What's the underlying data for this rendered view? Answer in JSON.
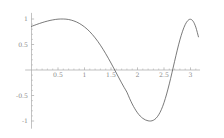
{
  "chart_data": {
    "type": "line",
    "title": "",
    "xlabel": "",
    "ylabel": "",
    "xlim": [
      -0.12,
      3.18
    ],
    "ylim": [
      -1.15,
      1.12
    ],
    "grid": false,
    "legend": null,
    "axis_style": "crossed-axes-at-origin",
    "line_color": "#4d4d4d",
    "axis_color": "#a8a8a8",
    "xticks": [
      0.5,
      1,
      1.5,
      2,
      2.5,
      3
    ],
    "xtick_labels": [
      "0.5",
      "1",
      "1.5",
      "2",
      "2.5",
      "3"
    ],
    "xticks_minor": [
      0.1,
      0.2,
      0.3,
      0.4,
      0.6,
      0.7,
      0.8,
      0.9,
      1.1,
      1.2,
      1.3,
      1.4,
      1.6,
      1.7,
      1.8,
      1.9,
      2.1,
      2.2,
      2.3,
      2.4,
      2.6,
      2.7,
      2.8,
      2.9,
      3.1
    ],
    "yticks": [
      -1,
      -0.5,
      0.5,
      1
    ],
    "ytick_labels": [
      "-1",
      "-0.5",
      "0.5",
      "1"
    ],
    "yticks_minor": [
      -0.9,
      -0.8,
      -0.7,
      -0.6,
      -0.4,
      -0.3,
      -0.2,
      -0.1,
      0.1,
      0.2,
      0.3,
      0.4,
      0.6,
      0.7,
      0.8,
      0.9
    ],
    "series": [
      {
        "name": "curve",
        "x": [
          0.0,
          0.05,
          0.1,
          0.15,
          0.2,
          0.25,
          0.3,
          0.35,
          0.4,
          0.45,
          0.5,
          0.55,
          0.6,
          0.65,
          0.7,
          0.75,
          0.8,
          0.85,
          0.9,
          0.95,
          1.0,
          1.05,
          1.1,
          1.15,
          1.2,
          1.25,
          1.3,
          1.35,
          1.4,
          1.45,
          1.5,
          1.55,
          1.6,
          1.65,
          1.7,
          1.75,
          1.8,
          1.85,
          1.9,
          1.95,
          2.0,
          2.05,
          2.1,
          2.15,
          2.2,
          2.25,
          2.3,
          2.35,
          2.4,
          2.45,
          2.5,
          2.55,
          2.6,
          2.65,
          2.7,
          2.75,
          2.8,
          2.85,
          2.9,
          2.95,
          3.0,
          3.05,
          3.1,
          3.15
        ],
        "y": [
          0.855,
          0.875,
          0.894,
          0.912,
          0.929,
          0.945,
          0.959,
          0.972,
          0.982,
          0.991,
          0.997,
          1.0,
          1.0,
          0.997,
          0.99,
          0.978,
          0.962,
          0.941,
          0.915,
          0.883,
          0.845,
          0.801,
          0.751,
          0.694,
          0.631,
          0.562,
          0.487,
          0.406,
          0.32,
          0.23,
          0.136,
          0.04,
          -0.058,
          -0.156,
          -0.253,
          -0.346,
          -0.435,
          -0.556,
          -0.666,
          -0.76,
          -0.84,
          -0.902,
          -0.948,
          -0.979,
          -0.996,
          -1.0,
          -0.985,
          -0.946,
          -0.878,
          -0.777,
          -0.64,
          -0.47,
          -0.272,
          -0.055,
          0.17,
          0.39,
          0.59,
          0.76,
          0.89,
          0.97,
          0.995,
          0.955,
          0.84,
          0.65
        ]
      }
    ]
  }
}
